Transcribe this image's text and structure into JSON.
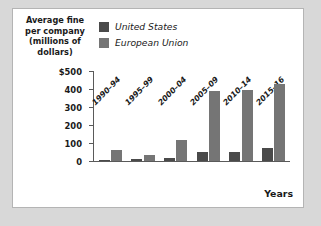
{
  "chart_data": {
    "type": "bar",
    "title": "",
    "ylabel": "Average fine per company (millions of dollars)",
    "xlabel": "Years",
    "categories": [
      "1990–94",
      "1995–99",
      "2000–04",
      "2005–09",
      "2010–14",
      "2015–16"
    ],
    "series": [
      {
        "name": "United States",
        "color": "#4a4a4a",
        "values": [
          5,
          12,
          15,
          50,
          52,
          70
        ]
      },
      {
        "name": "European Union",
        "color": "#757575",
        "values": [
          60,
          35,
          118,
          388,
          392,
          430
        ]
      }
    ],
    "ylim": [
      0,
      500
    ],
    "yticks": [
      0,
      100,
      200,
      300,
      400,
      500
    ],
    "ytick_labels": [
      "0",
      "100",
      "200",
      "300",
      "400",
      "$500"
    ],
    "grid": false,
    "legend_position": "top-left"
  },
  "figure": {
    "background": "#ffffff",
    "page_background": "#d8d8d8",
    "border_color": "#b4b4b4",
    "axis_color": "#5a5a5a"
  }
}
